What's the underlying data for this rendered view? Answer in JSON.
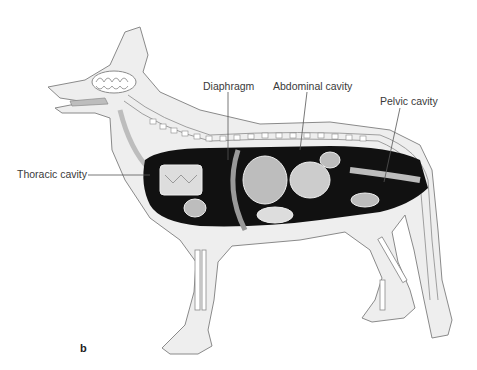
{
  "figure": {
    "panel_letter": "b",
    "labels": [
      {
        "id": "thoracic",
        "text": "Thoracic cavity",
        "x": 17,
        "y": 168
      },
      {
        "id": "diaphragm",
        "text": "Diaphragm",
        "x": 203,
        "y": 80
      },
      {
        "id": "abdominal",
        "text": "Abdominal cavity",
        "x": 273,
        "y": 80
      },
      {
        "id": "pelvic",
        "text": "Pelvic cavity",
        "x": 380,
        "y": 95
      }
    ],
    "colors": {
      "body_fill": "#eeeeee",
      "outline": "#8a8a8a",
      "cavity": "#111111",
      "organ": "#bdbdbd",
      "leader": "#555555"
    }
  }
}
